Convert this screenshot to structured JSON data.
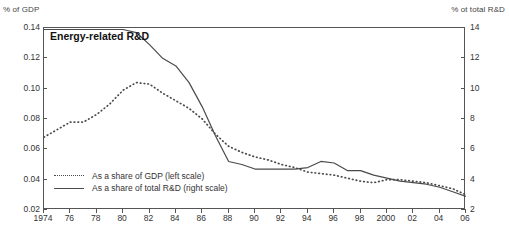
{
  "chart_data": {
    "type": "line",
    "title": "Energy-related R&D",
    "xlabel": "",
    "ylabel": "% of GDP",
    "y2label": "% ot total R&D",
    "grid": false,
    "legend_position": "inside-bottom-left",
    "x": [
      1974,
      1975,
      1976,
      1977,
      1978,
      1979,
      1980,
      1981,
      1982,
      1983,
      1984,
      1985,
      1986,
      1987,
      1988,
      1989,
      1990,
      1991,
      1992,
      1993,
      1994,
      1995,
      1996,
      1997,
      1998,
      1999,
      2000,
      2001,
      2002,
      2003,
      2004,
      2005,
      2006
    ],
    "xtick_labels": [
      "1974",
      "76",
      "78",
      "80",
      "82",
      "84",
      "86",
      "88",
      "90",
      "92",
      "94",
      "96",
      "98",
      "2000",
      "02",
      "04",
      "06"
    ],
    "xtick_values": [
      1974,
      1976,
      1978,
      1980,
      1982,
      1984,
      1986,
      1988,
      1990,
      1992,
      1994,
      1996,
      1998,
      2000,
      2002,
      2004,
      2006
    ],
    "xlim": [
      1974,
      2006
    ],
    "ylim": [
      0.02,
      0.14
    ],
    "ytick_values": [
      0.02,
      0.04,
      0.06,
      0.08,
      0.1,
      0.12,
      0.14
    ],
    "ytick_labels": [
      "0.02",
      "0.04",
      "0.06",
      "0.08",
      "0.10",
      "0.12",
      "0.14"
    ],
    "y2lim": [
      2,
      14
    ],
    "y2tick_values": [
      2,
      4,
      6,
      8,
      10,
      12,
      14
    ],
    "y2tick_labels": [
      "2",
      "4",
      "6",
      "8",
      "10",
      "12",
      "14"
    ],
    "series": [
      {
        "name": "As a share of GDP (left scale)",
        "axis": "left",
        "style": "dotted",
        "color": "#4a4a4a",
        "values": [
          0.068,
          0.073,
          0.078,
          0.078,
          0.083,
          0.09,
          0.099,
          0.104,
          0.103,
          0.097,
          0.092,
          0.087,
          0.08,
          0.07,
          0.062,
          0.058,
          0.055,
          0.053,
          0.05,
          0.048,
          0.045,
          0.044,
          0.043,
          0.041,
          0.039,
          0.038,
          0.04,
          0.04,
          0.039,
          0.038,
          0.036,
          0.034,
          0.03
        ]
      },
      {
        "name": "As a share of total R&D (right scale)",
        "axis": "right",
        "style": "solid",
        "color": "#4a4a4a",
        "values": [
          13.9,
          13.9,
          13.9,
          13.9,
          13.9,
          13.9,
          13.9,
          13.7,
          12.9,
          12.0,
          11.5,
          10.4,
          8.8,
          6.9,
          5.2,
          5.0,
          4.7,
          4.7,
          4.7,
          4.7,
          4.8,
          5.2,
          5.1,
          4.6,
          4.6,
          4.3,
          4.1,
          3.9,
          3.8,
          3.7,
          3.5,
          3.2,
          2.9
        ]
      }
    ]
  },
  "captions": {
    "left": "% of GDP",
    "right": "% ot total R&D"
  },
  "legend": [
    {
      "label": "As a share of GDP (left scale)",
      "style": "dotted"
    },
    {
      "label": "As a share of total R&D (right scale)",
      "style": "solid"
    }
  ]
}
